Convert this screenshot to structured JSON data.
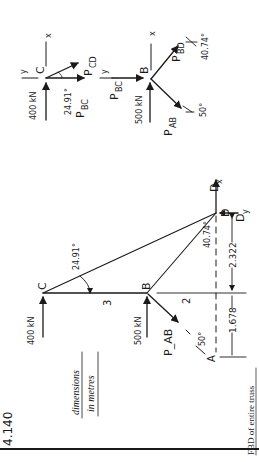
{
  "problem_number": "4.140",
  "caption": "FBD of entire truss",
  "units_note": {
    "line1": "dimensions",
    "line2": "in metres"
  },
  "colors": {
    "ink": "#1a1a1a",
    "paper": "#ffffff"
  },
  "truss": {
    "joints": {
      "A": {
        "label": "A"
      },
      "B": {
        "label": "B"
      },
      "C": {
        "label": "C"
      },
      "D": {
        "label": "D"
      }
    },
    "loads": {
      "C": "400 kN",
      "B": "500 kN"
    },
    "members": {
      "AB": "P_AB",
      "BC": "P_BC",
      "BD": "P_BD",
      "CD": "P_CD"
    },
    "reactions": {
      "Dx": "D",
      "Dx_sub": "x",
      "Dy": "D",
      "Dy_sub": "y"
    },
    "angles": {
      "C": "24.91°",
      "D": "40.74°",
      "A": "50°"
    },
    "dimensions": {
      "CB": "3",
      "B_offset": "2",
      "lower": "1.678",
      "upper": "2.322"
    }
  },
  "fbd_joint_C": {
    "label": "C",
    "load": "400 kN",
    "axis_x": "x",
    "axis_y": "y",
    "member_1": {
      "base": "P",
      "sub": "CD"
    },
    "member_2": {
      "base": "P",
      "sub": "BC"
    },
    "angle": "24.91°"
  },
  "fbd_joint_B": {
    "label": "B",
    "load": "500 kN",
    "axis_x": "x",
    "axis_y": "y",
    "member_bd": {
      "base": "P",
      "sub": "BD"
    },
    "member_ab": {
      "base": "P",
      "sub": "AB"
    },
    "member_bc": {
      "base": "P",
      "sub": "BC"
    },
    "angle_bd": "40.74°",
    "angle_ab": "50°"
  }
}
